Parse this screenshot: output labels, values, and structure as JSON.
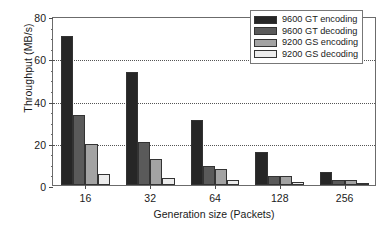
{
  "chart_data": {
    "type": "bar",
    "title": "",
    "xlabel": "Generation size (Packets)",
    "ylabel": "Throughput (MB/s)",
    "categories": [
      "16",
      "32",
      "64",
      "128",
      "256"
    ],
    "ylim": [
      0,
      80
    ],
    "yticks": [
      0,
      20,
      40,
      60,
      80
    ],
    "ytick_labels": [
      "0",
      "20",
      "40",
      "60",
      "80"
    ],
    "yminor_step": 5,
    "grid": true,
    "grid_axis": "y",
    "grid_style": "dotted",
    "legend_position": "top-right",
    "series": [
      {
        "name": "9600 GT encoding",
        "color": "#262626",
        "values": [
          70.5,
          53.5,
          31.0,
          15.5,
          6.3
        ]
      },
      {
        "name": "9600 GT decoding",
        "color": "#5a5a5a",
        "values": [
          33.0,
          20.5,
          9.0,
          4.5,
          2.5
        ]
      },
      {
        "name": "9200 GS encoding",
        "color": "#a3a3a3",
        "values": [
          19.5,
          12.5,
          7.7,
          4.2,
          2.5
        ]
      },
      {
        "name": "9200 GS decoding",
        "color": "#ececec",
        "values": [
          5.2,
          3.5,
          2.5,
          1.6,
          1.0
        ]
      }
    ]
  },
  "legend": {
    "entries": [
      "9600 GT encoding",
      "9600 GT decoding",
      "9200 GS encoding",
      "9200 GS decoding"
    ]
  },
  "axes": {
    "y_title": "Throughput (MB/s)",
    "x_title": "Generation size (Packets)",
    "y_tick_labels": [
      "0",
      "20",
      "40",
      "60",
      "80"
    ],
    "x_tick_labels": [
      "16",
      "32",
      "64",
      "128",
      "256"
    ]
  },
  "colors": {
    "frame": "#6b6b6b",
    "grid": "#555555",
    "text": "#1a1a1a",
    "background": "#ffffff"
  }
}
